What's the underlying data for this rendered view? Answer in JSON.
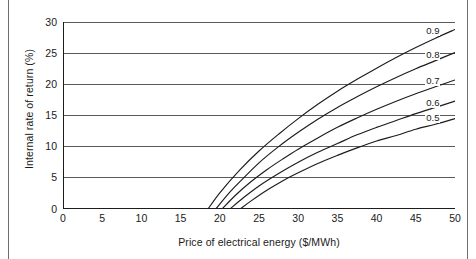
{
  "chart_data": {
    "type": "line",
    "title": "",
    "xlabel": "Price of electrical energy ($/MWh)",
    "ylabel": "Internal rate of return (%)",
    "xlim": [
      0,
      50
    ],
    "ylim": [
      0,
      30
    ],
    "xticks": [
      0,
      5,
      10,
      15,
      20,
      25,
      30,
      35,
      40,
      45,
      50
    ],
    "yticks": [
      0,
      5,
      10,
      15,
      20,
      25,
      30
    ],
    "grid": "horizontal",
    "legend_position": "inline-end-labels",
    "series": [
      {
        "name": "0.9",
        "label": "0.9",
        "x": [
          18.5,
          20,
          22.5,
          25,
          27.5,
          30,
          32.5,
          35,
          37.5,
          40,
          42.5,
          45,
          47.5,
          50
        ],
        "values": [
          0,
          2.6,
          6.2,
          9.3,
          12.0,
          14.5,
          16.8,
          18.9,
          20.8,
          22.6,
          24.3,
          25.9,
          27.4,
          28.8
        ]
      },
      {
        "name": "0.8",
        "label": "0.8",
        "x": [
          19.5,
          21,
          22.5,
          25,
          27.5,
          30,
          32.5,
          35,
          37.5,
          40,
          42.5,
          45,
          47.5,
          50
        ],
        "values": [
          0,
          2.3,
          4.3,
          7.4,
          10.0,
          12.3,
          14.4,
          16.3,
          18.0,
          19.6,
          21.1,
          22.5,
          23.8,
          25.1
        ]
      },
      {
        "name": "0.7",
        "label": "0.7",
        "x": [
          20.3,
          22,
          24,
          26,
          28,
          30,
          32.5,
          35,
          37.5,
          40,
          42.5,
          45,
          47.5,
          50
        ],
        "values": [
          0,
          2.2,
          4.4,
          6.3,
          8.0,
          9.6,
          11.4,
          13.1,
          14.6,
          16.0,
          17.3,
          18.5,
          19.6,
          20.7
        ]
      },
      {
        "name": "0.6",
        "label": "0.6",
        "x": [
          21.3,
          23,
          25,
          27.5,
          30,
          32.5,
          35,
          37.5,
          40,
          42.5,
          45,
          47.5,
          50
        ],
        "values": [
          0,
          1.8,
          3.7,
          5.7,
          7.5,
          9.1,
          10.5,
          11.9,
          13.1,
          14.2,
          15.3,
          16.3,
          17.3
        ]
      },
      {
        "name": "0.5",
        "label": "0.5",
        "x": [
          22.6,
          24,
          26,
          28,
          30,
          32.5,
          35,
          37.5,
          40,
          42.5,
          45,
          47.5,
          50
        ],
        "values": [
          0,
          1.3,
          3.0,
          4.5,
          5.8,
          7.3,
          8.6,
          9.8,
          10.9,
          11.8,
          12.8,
          13.6,
          14.5
        ]
      }
    ],
    "annotations": [
      {
        "text": "0.9",
        "x": 46.2,
        "y": 28.4
      },
      {
        "text": "0.8",
        "x": 46.2,
        "y": 24.6
      },
      {
        "text": "0.7",
        "x": 46.2,
        "y": 20.3
      },
      {
        "text": "0.6",
        "x": 46.2,
        "y": 16.9
      },
      {
        "text": "0.5",
        "x": 46.2,
        "y": 14.5
      }
    ],
    "colors": {
      "line": "#1c1c1c",
      "grid": "#5a5a5a",
      "axis": "#1c1c1c",
      "background": "#ffffff"
    }
  }
}
